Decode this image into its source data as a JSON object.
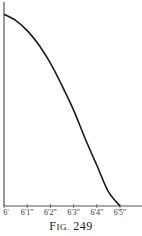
{
  "chart_data": {
    "type": "line",
    "title": "",
    "xlabel": "",
    "ylabel": "",
    "x_ticks": [
      "6'",
      "6'1\"",
      "6'2\"",
      "6'3\"",
      "6'4\"",
      "6'5\""
    ],
    "x_inches": [
      72,
      73,
      74,
      75,
      76,
      77
    ],
    "series": [
      {
        "name": "curve",
        "points": [
          {
            "x": 72.0,
            "y": 0.94
          },
          {
            "x": 72.5,
            "y": 0.91
          },
          {
            "x": 73.0,
            "y": 0.86
          },
          {
            "x": 73.5,
            "y": 0.79
          },
          {
            "x": 74.0,
            "y": 0.7
          },
          {
            "x": 74.5,
            "y": 0.59
          },
          {
            "x": 75.0,
            "y": 0.47
          },
          {
            "x": 75.5,
            "y": 0.33
          },
          {
            "x": 76.0,
            "y": 0.2
          },
          {
            "x": 76.5,
            "y": 0.07
          },
          {
            "x": 77.0,
            "y": 0.0
          }
        ]
      }
    ],
    "xlim": [
      72,
      78
    ],
    "ylim": [
      0,
      1
    ],
    "grid": false,
    "legend": "none"
  },
  "figure": {
    "caption_prefix": "F",
    "caption_smallcaps": "IG.",
    "caption_number": "249"
  },
  "colors": {
    "line": "#1a1a1a",
    "axis": "#555555",
    "background": "#ffffff"
  }
}
